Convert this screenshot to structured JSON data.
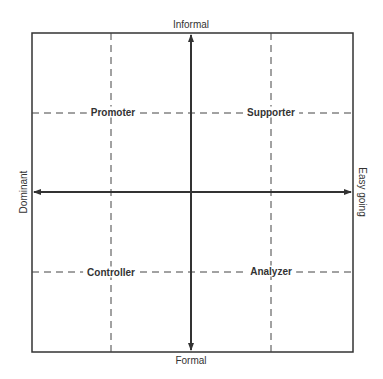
{
  "diagram": {
    "axes": {
      "top": "Informal",
      "bottom": "Formal",
      "left": "Dominant",
      "right": "Easy going"
    },
    "quadrants": [
      {
        "position": "top-left",
        "label": "Promoter"
      },
      {
        "position": "top-right",
        "label": "Supporter"
      },
      {
        "position": "bottom-left",
        "label": "Controller"
      },
      {
        "position": "bottom-right",
        "label": "Analyzer"
      }
    ]
  }
}
